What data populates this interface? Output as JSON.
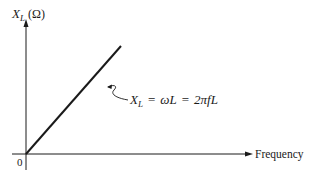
{
  "diagram": {
    "y_axis": {
      "symbol": "X",
      "subscript": "L",
      "unit": "(Ω)"
    },
    "x_axis": {
      "label": "Frequency"
    },
    "origin_label": "0",
    "line_annotation": {
      "lhs_symbol": "X",
      "lhs_subscript": "L",
      "eq1": "=",
      "omega_l": "ωL",
      "eq2": "=",
      "two_pi_fl": "2πfL"
    },
    "colors": {
      "ink": "#1a1a1a",
      "background": "#ffffff"
    }
  }
}
